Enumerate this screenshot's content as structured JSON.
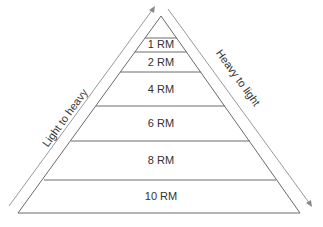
{
  "diagram": {
    "type": "pyramid",
    "colors": {
      "line": "#6a6a6a",
      "arrow": "#9a9a9a",
      "text": "#333333"
    },
    "tiers": [
      {
        "label": "1 RM"
      },
      {
        "label": "2 RM"
      },
      {
        "label": "4 RM"
      },
      {
        "label": "6 RM"
      },
      {
        "label": "8 RM"
      },
      {
        "label": "10 RM"
      }
    ],
    "left_arrow": {
      "label": "Light to heavy",
      "direction": "up"
    },
    "right_arrow": {
      "label": "Heavy to light",
      "direction": "down"
    }
  }
}
